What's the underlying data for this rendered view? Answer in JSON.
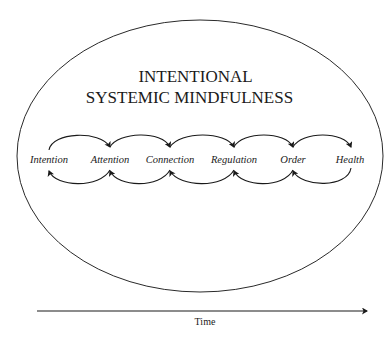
{
  "diagram": {
    "title_line1": "INTENTIONAL",
    "title_line2": "SYSTEMIC MINDFULNESS",
    "stages": [
      {
        "label": "Intention",
        "x": 49
      },
      {
        "label": "Attention",
        "x": 110
      },
      {
        "label": "Connection",
        "x": 170
      },
      {
        "label": "Regulation",
        "x": 234
      },
      {
        "label": "Order",
        "x": 293
      },
      {
        "label": "Health",
        "x": 351
      }
    ],
    "flow": {
      "forward": "upper arcs with arrows pointing to the next stage",
      "backward": "lower arcs with arrows pointing to the previous stage"
    },
    "axis": {
      "label": "Time",
      "direction": "left-to-right arrow"
    },
    "colors": {
      "line": "#1a1a1a",
      "background": "#ffffff"
    }
  }
}
